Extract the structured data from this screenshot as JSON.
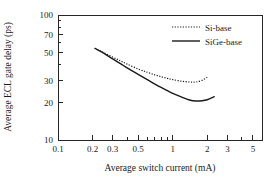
{
  "chart_data": {
    "type": "line",
    "title": "",
    "xlabel": "Average switch current (mA)",
    "ylabel": "Average ECL gate delay (ps)",
    "xscale": "log",
    "yscale": "log",
    "xlim": [
      0.1,
      6.0
    ],
    "ylim": [
      10,
      100
    ],
    "grid": false,
    "legend_position": "top-right",
    "xticks": [
      0.1,
      0.2,
      0.3,
      0.5,
      1,
      2,
      3,
      5
    ],
    "xticklabels": [
      "0.1",
      "0.2",
      "0.3",
      "0.5",
      "1",
      "2",
      "3",
      "5"
    ],
    "yticks": [
      10,
      20,
      30,
      50,
      70,
      100
    ],
    "yticklabels": [
      "10",
      "20",
      "30",
      "50",
      "70",
      "100"
    ],
    "series": [
      {
        "name": "Si-base",
        "style": "dotted",
        "color": "#1a1a1a",
        "x": [
          0.22,
          0.25,
          0.3,
          0.35,
          0.4,
          0.5,
          0.6,
          0.7,
          0.8,
          0.9,
          1.0,
          1.2,
          1.4,
          1.5,
          1.6,
          1.8,
          2.0
        ],
        "y": [
          53.0,
          50.0,
          46.0,
          43.0,
          40.5,
          37.0,
          34.8,
          33.2,
          32.0,
          31.1,
          30.4,
          29.5,
          29.1,
          29.0,
          29.1,
          30.0,
          31.8
        ]
      },
      {
        "name": "SiGe-base",
        "style": "solid",
        "color": "#1a1a1a",
        "x": [
          0.21,
          0.25,
          0.3,
          0.35,
          0.4,
          0.5,
          0.6,
          0.7,
          0.8,
          0.9,
          1.0,
          1.2,
          1.4,
          1.6,
          1.8,
          2.0,
          2.3
        ],
        "y": [
          54.0,
          49.5,
          44.5,
          40.8,
          37.8,
          33.5,
          30.4,
          28.0,
          26.2,
          24.8,
          23.6,
          22.0,
          20.9,
          20.5,
          20.6,
          21.0,
          22.2
        ]
      }
    ]
  },
  "legend": {
    "entries": [
      {
        "label": "Si-base",
        "style": "dotted"
      },
      {
        "label": "SiGe-base",
        "style": "solid"
      }
    ]
  },
  "axes": {
    "x_title": "Average switch current (mA)",
    "y_title": "Average ECL gate delay (ps)",
    "x_tick_labels": [
      "0.1",
      "0.2",
      "0.3",
      "0.5",
      "1",
      "2",
      "3",
      "5"
    ],
    "y_tick_labels": [
      "100",
      "70",
      "50",
      "30",
      "20",
      "10"
    ]
  }
}
